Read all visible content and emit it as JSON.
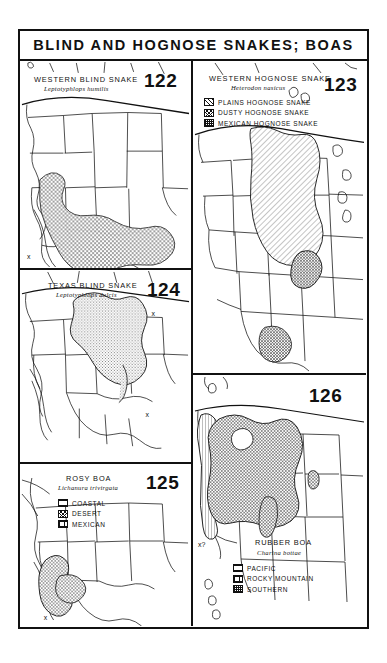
{
  "plate": {
    "title": "BLIND AND HOGNOSE SNAKES; BOAS"
  },
  "panels": [
    {
      "id": "122",
      "number": "122",
      "common_name": "WESTERN BLIND SNAKE",
      "scientific_name": "Leptotyphlops humilis",
      "legend": []
    },
    {
      "id": "123",
      "number": "123",
      "common_name": "WESTERN HOGNOSE SNAKE",
      "scientific_name": "Heterodon nasicus",
      "legend": [
        {
          "label": "PLAINS HOGNOSE SNAKE",
          "pattern": "diagonal-hatch"
        },
        {
          "label": "DUSTY HOGNOSE SNAKE",
          "pattern": "cross-hatch"
        },
        {
          "label": "MEXICAN HOGNOSE SNAKE",
          "pattern": "stipple-grid"
        }
      ]
    },
    {
      "id": "124",
      "number": "124",
      "common_name": "TEXAS BLIND SNAKE",
      "scientific_name": "Leptotyphlops dulcis",
      "legend": []
    },
    {
      "id": "125",
      "number": "125",
      "common_name": "ROSY BOA",
      "scientific_name": "Lichanura trivirgata",
      "legend": [
        {
          "label": "COASTAL",
          "pattern": "horizontal-grid"
        },
        {
          "label": "DESERT",
          "pattern": "cross-hatch"
        },
        {
          "label": "MEXICAN",
          "pattern": "grid"
        }
      ]
    },
    {
      "id": "126",
      "number": "126",
      "common_name": "RUBBER BOA",
      "scientific_name": "Charina bottae",
      "legend": [
        {
          "label": "PACIFIC",
          "pattern": "horizontal-grid"
        },
        {
          "label": "ROCKY MOUNTAIN",
          "pattern": "grid"
        },
        {
          "label": "SOUTHERN",
          "pattern": "stipple-grid"
        }
      ]
    }
  ],
  "markers": {
    "panel_122_x": "x",
    "panel_124_x1": "x",
    "panel_124_x2": "x",
    "panel_125_x": "x",
    "panel_126_query": "x?"
  },
  "colors": {
    "ink": "#111111",
    "paper": "#ffffff",
    "range_shade": "#9a9a9a"
  }
}
